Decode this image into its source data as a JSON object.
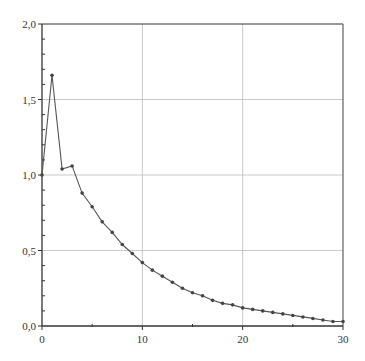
{
  "chart_data": {
    "type": "line",
    "title": "",
    "xlabel": "",
    "ylabel": "",
    "xlim": [
      0,
      30
    ],
    "ylim": [
      0,
      2.0
    ],
    "grid": true,
    "legend": null,
    "x_ticks": [
      0,
      10,
      20,
      30
    ],
    "x_tick_labels": [
      "0",
      "10",
      "20",
      "30"
    ],
    "x_minor_ticks": [
      5,
      15,
      25
    ],
    "y_ticks": [
      0,
      0.5,
      1.0,
      1.5,
      2.0
    ],
    "y_tick_labels": [
      "0,0",
      "0,5",
      "1,0",
      "1,5",
      "2,0"
    ],
    "y_minor_step": 0.1,
    "x": [
      0,
      1,
      2,
      3,
      4,
      5,
      6,
      7,
      8,
      9,
      10,
      11,
      12,
      13,
      14,
      15,
      16,
      17,
      18,
      19,
      20,
      21,
      22,
      23,
      24,
      25,
      26,
      27,
      28,
      29,
      30
    ],
    "series": [
      {
        "name": "series-1",
        "color": "#555555",
        "marker": "dot",
        "values": [
          1.0,
          1.66,
          1.04,
          1.06,
          0.88,
          0.79,
          0.69,
          0.62,
          0.54,
          0.48,
          0.42,
          0.37,
          0.33,
          0.29,
          0.25,
          0.22,
          0.2,
          0.17,
          0.15,
          0.14,
          0.12,
          0.11,
          0.1,
          0.09,
          0.08,
          0.07,
          0.06,
          0.05,
          0.04,
          0.03,
          0.03
        ]
      }
    ]
  },
  "style": {
    "axis_color": "#333333",
    "grid_color": "#bbbbbb",
    "line_color": "#555555",
    "marker_color": "#444444"
  }
}
